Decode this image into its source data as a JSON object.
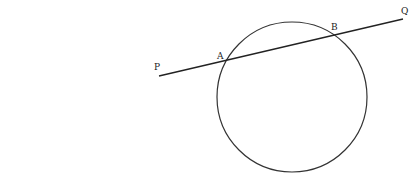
{
  "diagram": {
    "circle": {
      "cx": 292,
      "cy": 97,
      "r": 75,
      "stroke": "#333333"
    },
    "line": {
      "x1": 159,
      "y1": 76,
      "x2": 403,
      "y2": 19,
      "stroke": "#222222"
    },
    "labels": {
      "P": "P",
      "Q": "Q",
      "A": "A",
      "B": "B"
    }
  }
}
